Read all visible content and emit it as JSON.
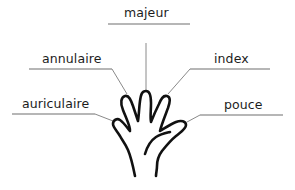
{
  "diagram": {
    "type": "labeled-illustration",
    "labels": [
      {
        "id": "majeur",
        "text": "majeur"
      },
      {
        "id": "annulaire",
        "text": "annulaire"
      },
      {
        "id": "index",
        "text": "index"
      },
      {
        "id": "auriculaire",
        "text": "auriculaire"
      },
      {
        "id": "pouce",
        "text": "pouce"
      }
    ]
  },
  "colors": {
    "text": "#1c1c1c",
    "leader_lines": "#8a8a8a",
    "hand_outline": "#111111",
    "background": "#ffffff"
  }
}
